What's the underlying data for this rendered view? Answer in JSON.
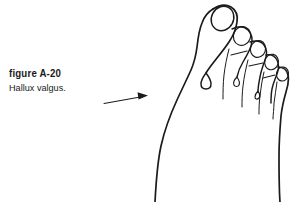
{
  "figure": {
    "number_label": "figure A-20",
    "caption": "Hallux valgus.",
    "alt_description": "Line drawing of a right foot seen from above showing hallux valgus, the great toe deviating laterally with a prominent bunion at the first metatarsophalangeal joint.",
    "ink_color": "#1b1b1b",
    "background_color": "#ffffff"
  },
  "annotation": {
    "arrow_name": "leader-arrow",
    "arrow_points_to": "bunion prominence at first metatarsophalangeal joint",
    "arrow_direction": "right"
  },
  "anatomy": {
    "parts": [
      {
        "name": "hallux",
        "label": "great toe"
      },
      {
        "name": "hallux-nail",
        "label": "great toenail"
      },
      {
        "name": "second-toe",
        "label": "second toe"
      },
      {
        "name": "third-toe",
        "label": "third toe"
      },
      {
        "name": "fourth-toe",
        "label": "fourth toe"
      },
      {
        "name": "fifth-toe",
        "label": "fifth toe"
      },
      {
        "name": "bunion",
        "label": "bunion prominence"
      },
      {
        "name": "medial-border",
        "label": "medial border of foot"
      },
      {
        "name": "lateral-border",
        "label": "lateral border of foot"
      }
    ]
  }
}
